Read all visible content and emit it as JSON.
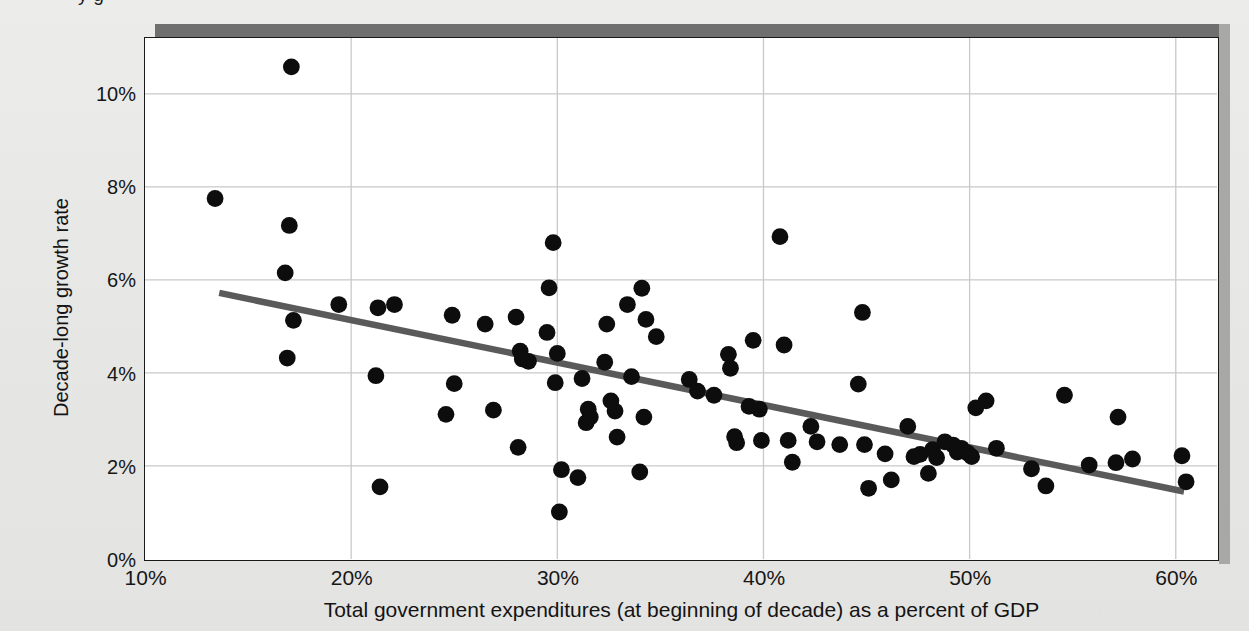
{
  "figure": {
    "cut_off_top_text": "y     g",
    "background_color": "#e8e8e6",
    "plot_background_color": "#ffffff",
    "frame_color": "#1a1a1a",
    "gridline_color": "#c9c9c9",
    "marker_color": "#0d0d0d",
    "trendline_color": "#5a5a5a",
    "shadow_color": "#6f6f6f"
  },
  "chart_data": {
    "type": "scatter",
    "title": "",
    "xlabel": "Total government expenditures (at beginning of decade) as a percent of GDP",
    "ylabel": "Decade-long growth rate",
    "xlim": [
      10,
      62
    ],
    "ylim": [
      0,
      11.2
    ],
    "grid": true,
    "legend": "none",
    "xticks": [
      10,
      20,
      30,
      40,
      50,
      60
    ],
    "xtick_labels": [
      "10%",
      "20%",
      "30%",
      "40%",
      "50%",
      "60%"
    ],
    "yticks": [
      0,
      2,
      4,
      6,
      8,
      10
    ],
    "ytick_labels": [
      "0%",
      "2%",
      "4%",
      "6%",
      "8%",
      "10%"
    ],
    "trendline": {
      "type": "linear-fit",
      "x_start": 13.6,
      "y_start": 5.72,
      "x_end": 60.4,
      "y_end": 1.45
    },
    "points": [
      [
        17.1,
        10.58
      ],
      [
        13.4,
        7.75
      ],
      [
        17.0,
        7.17
      ],
      [
        16.8,
        6.15
      ],
      [
        16.9,
        4.32
      ],
      [
        19.4,
        5.47
      ],
      [
        17.2,
        5.13
      ],
      [
        21.3,
        5.4
      ],
      [
        22.1,
        5.47
      ],
      [
        21.2,
        3.94
      ],
      [
        21.4,
        1.55
      ],
      [
        24.9,
        5.24
      ],
      [
        25.0,
        3.77
      ],
      [
        24.6,
        3.11
      ],
      [
        26.5,
        5.05
      ],
      [
        26.9,
        3.2
      ],
      [
        28.2,
        4.47
      ],
      [
        28.3,
        4.3
      ],
      [
        28.6,
        4.25
      ],
      [
        28.0,
        5.2
      ],
      [
        28.1,
        2.4
      ],
      [
        29.8,
        6.8
      ],
      [
        29.6,
        5.83
      ],
      [
        29.5,
        4.87
      ],
      [
        30.0,
        4.42
      ],
      [
        29.9,
        3.79
      ],
      [
        30.2,
        1.92
      ],
      [
        30.1,
        1.01
      ],
      [
        31.2,
        3.88
      ],
      [
        31.5,
        3.22
      ],
      [
        31.6,
        3.05
      ],
      [
        31.4,
        2.93
      ],
      [
        31.0,
        1.75
      ],
      [
        32.4,
        5.05
      ],
      [
        32.3,
        4.23
      ],
      [
        32.6,
        3.4
      ],
      [
        32.8,
        3.18
      ],
      [
        32.9,
        2.62
      ],
      [
        33.4,
        5.47
      ],
      [
        33.6,
        3.92
      ],
      [
        34.1,
        5.82
      ],
      [
        34.3,
        5.15
      ],
      [
        34.8,
        4.78
      ],
      [
        34.2,
        3.05
      ],
      [
        34.0,
        1.87
      ],
      [
        36.4,
        3.86
      ],
      [
        36.8,
        3.61
      ],
      [
        37.6,
        3.52
      ],
      [
        38.4,
        4.1
      ],
      [
        38.3,
        4.4
      ],
      [
        38.6,
        2.63
      ],
      [
        38.7,
        2.5
      ],
      [
        39.5,
        4.7
      ],
      [
        39.3,
        3.28
      ],
      [
        39.8,
        3.22
      ],
      [
        39.9,
        2.55
      ],
      [
        40.8,
        6.93
      ],
      [
        41.0,
        4.6
      ],
      [
        41.2,
        2.55
      ],
      [
        41.4,
        2.08
      ],
      [
        42.3,
        2.85
      ],
      [
        42.6,
        2.52
      ],
      [
        43.7,
        2.46
      ],
      [
        44.8,
        5.3
      ],
      [
        44.6,
        3.76
      ],
      [
        44.9,
        2.46
      ],
      [
        45.1,
        1.52
      ],
      [
        45.9,
        2.26
      ],
      [
        46.2,
        1.7
      ],
      [
        47.0,
        2.85
      ],
      [
        47.3,
        2.2
      ],
      [
        47.6,
        2.25
      ],
      [
        48.2,
        2.35
      ],
      [
        48.4,
        2.18
      ],
      [
        48.0,
        1.84
      ],
      [
        48.8,
        2.52
      ],
      [
        49.2,
        2.45
      ],
      [
        49.4,
        2.3
      ],
      [
        49.6,
        2.38
      ],
      [
        49.9,
        2.28
      ],
      [
        50.1,
        2.2
      ],
      [
        50.3,
        3.25
      ],
      [
        50.8,
        3.4
      ],
      [
        51.3,
        2.38
      ],
      [
        53.0,
        1.94
      ],
      [
        53.7,
        1.57
      ],
      [
        54.6,
        3.52
      ],
      [
        55.8,
        2.02
      ],
      [
        57.2,
        3.05
      ],
      [
        57.1,
        2.07
      ],
      [
        57.9,
        2.15
      ],
      [
        60.3,
        2.22
      ],
      [
        60.5,
        1.66
      ]
    ]
  }
}
